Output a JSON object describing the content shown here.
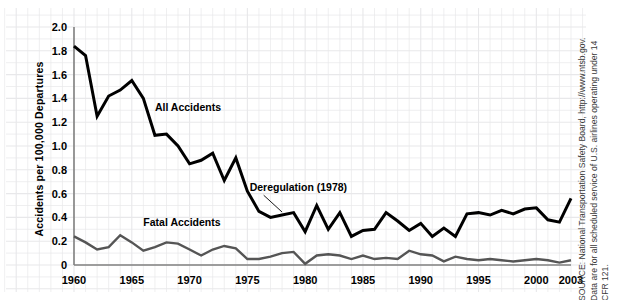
{
  "chart_data": {
    "type": "line",
    "title": "",
    "xlabel": "",
    "ylabel": "Accidents per 100,000 Departures",
    "xlim": [
      1960,
      2003
    ],
    "ylim": [
      0,
      2.0
    ],
    "grid": true,
    "legend_position": "inline-labels",
    "x": [
      1960,
      1961,
      1962,
      1963,
      1964,
      1965,
      1966,
      1967,
      1968,
      1969,
      1970,
      1971,
      1972,
      1973,
      1974,
      1975,
      1976,
      1977,
      1978,
      1979,
      1980,
      1981,
      1982,
      1983,
      1984,
      1985,
      1986,
      1987,
      1988,
      1989,
      1990,
      1991,
      1992,
      1993,
      1994,
      1995,
      1996,
      1997,
      1998,
      1999,
      2000,
      2001,
      2002,
      2003
    ],
    "xticks": [
      1960,
      1965,
      1970,
      1975,
      1980,
      1985,
      1990,
      1995,
      2000,
      2003
    ],
    "yticks": [
      "0",
      "0.2",
      "0.4",
      "0.6",
      "0.8",
      "1.0",
      "1.2",
      "1.4",
      "1.6",
      "1.8",
      "2.0"
    ],
    "series": [
      {
        "name": "All Accidents",
        "color": "#000000",
        "width": 3.0,
        "label_x": 1967.0,
        "label_y": 1.29,
        "values": [
          1.84,
          1.76,
          1.25,
          1.42,
          1.47,
          1.55,
          1.4,
          1.09,
          1.1,
          1.0,
          0.85,
          0.88,
          0.94,
          0.71,
          0.9,
          0.62,
          0.45,
          0.4,
          0.42,
          0.44,
          0.28,
          0.5,
          0.3,
          0.44,
          0.24,
          0.29,
          0.3,
          0.44,
          0.37,
          0.29,
          0.35,
          0.24,
          0.31,
          0.24,
          0.43,
          0.44,
          0.42,
          0.46,
          0.43,
          0.47,
          0.48,
          0.38,
          0.36,
          0.56
        ]
      },
      {
        "name": "Fatal Accidents",
        "color": "#555555",
        "width": 2.4,
        "label_x": 1966.0,
        "label_y": 0.33,
        "values": [
          0.24,
          0.19,
          0.13,
          0.15,
          0.25,
          0.19,
          0.12,
          0.15,
          0.19,
          0.18,
          0.13,
          0.08,
          0.13,
          0.16,
          0.14,
          0.05,
          0.05,
          0.07,
          0.1,
          0.11,
          0.01,
          0.08,
          0.09,
          0.08,
          0.05,
          0.08,
          0.05,
          0.06,
          0.05,
          0.12,
          0.09,
          0.08,
          0.03,
          0.07,
          0.05,
          0.04,
          0.05,
          0.04,
          0.03,
          0.04,
          0.05,
          0.04,
          0.02,
          0.04
        ]
      }
    ],
    "annotations": [
      {
        "text": "Deregulation (1978)",
        "text_x": 1975.2,
        "text_y": 0.62,
        "point_x": 1978.0,
        "point_y": 0.42
      }
    ]
  },
  "source": {
    "text": "SOURCE: National Transportation Safety Board, http://www.ntsb.gov.\nData are for all scheduled service of U.S. airlines operating under 14\nCFR 121."
  },
  "colors": {
    "grid": "#e8e8ea",
    "axis": "#808080",
    "all_accidents": "#000000",
    "fatal_accidents": "#555555"
  }
}
